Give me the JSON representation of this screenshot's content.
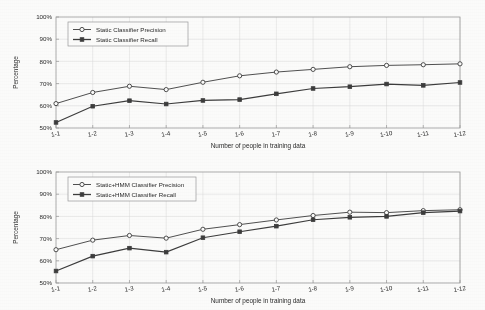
{
  "figure": {
    "background_color": "#fbfbfa",
    "axis_color": "#9a9a9a",
    "grid_color": "#d8d8d8",
    "series_color": "#3c3c3c"
  },
  "charts": [
    {
      "id": "top",
      "name": "static-classifier-chart",
      "chart_data": {
        "type": "line",
        "title": "",
        "xlabel": "Number of people in training data",
        "ylabel": "Percentage",
        "categories": [
          "1-1",
          "1-2",
          "1-3",
          "1-4",
          "1-5",
          "1-6",
          "1-7",
          "1-8",
          "1-9",
          "1-10",
          "1-11",
          "1-12"
        ],
        "ylim": [
          50,
          100
        ],
        "yticks": [
          50,
          60,
          70,
          80,
          90,
          100
        ],
        "ytick_labels": [
          "50%",
          "60%",
          "70%",
          "80%",
          "90%",
          "100%"
        ],
        "grid": true,
        "legend_position": "upper left",
        "series": [
          {
            "name": "Static Classifier Precision",
            "marker": "circle",
            "values": [
              61.0,
              66.0,
              68.8,
              67.3,
              70.6,
              73.5,
              75.2,
              76.4,
              77.6,
              78.2,
              78.5,
              78.9
            ]
          },
          {
            "name": "Static Classifier Recall",
            "marker": "square",
            "values": [
              52.5,
              59.8,
              62.3,
              60.8,
              62.4,
              62.8,
              65.4,
              67.8,
              68.6,
              69.8,
              69.2,
              70.5
            ]
          }
        ]
      }
    },
    {
      "id": "bottom",
      "name": "static-hmm-classifier-chart",
      "chart_data": {
        "type": "line",
        "title": "",
        "xlabel": "Number of people in training data",
        "ylabel": "Percentage",
        "categories": [
          "1-1",
          "1-2",
          "1-3",
          "1-4",
          "1-5",
          "1-6",
          "1-7",
          "1-8",
          "1-9",
          "1-10",
          "1-11",
          "1-12"
        ],
        "ylim": [
          50,
          100
        ],
        "yticks": [
          50,
          60,
          70,
          80,
          90,
          100
        ],
        "ytick_labels": [
          "50%",
          "60%",
          "70%",
          "80%",
          "90%",
          "100%"
        ],
        "grid": true,
        "legend_position": "upper left",
        "series": [
          {
            "name": "Static+HMM Classifier Precision",
            "marker": "circle",
            "values": [
              65.0,
              69.3,
              71.4,
              70.2,
              74.2,
              76.3,
              78.4,
              80.4,
              81.9,
              81.7,
              82.6,
              83.0
            ]
          },
          {
            "name": "Static+HMM Classifier Recall",
            "marker": "square",
            "values": [
              55.4,
              62.1,
              65.7,
              63.9,
              70.4,
              73.1,
              75.6,
              78.5,
              79.6,
              80.0,
              81.7,
              82.4
            ]
          }
        ]
      }
    }
  ]
}
